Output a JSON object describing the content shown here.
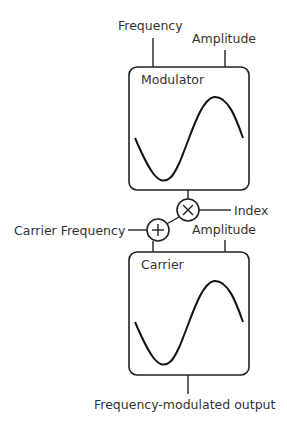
{
  "diagram": {
    "modulator": {
      "label": "Modulator",
      "inputs": {
        "frequency": "Frequency",
        "amplitude": "Amplitude"
      },
      "waveform": "sine"
    },
    "multiply": {
      "symbol": "X",
      "side_input": "Index"
    },
    "add": {
      "symbol": "+",
      "side_input": "Carrier Frequency"
    },
    "carrier": {
      "label": "Carrier",
      "inputs": {
        "amplitude": "Amplitude"
      },
      "waveform": "sine"
    },
    "output": {
      "label": "Frequency-modulated output"
    },
    "colors": {
      "line": "#222222",
      "text": "#333333",
      "background": "#ffffff"
    }
  }
}
